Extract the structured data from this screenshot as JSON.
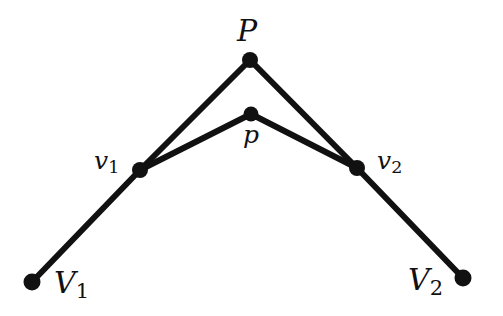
{
  "diagram": {
    "colors": {
      "stroke": "#111111",
      "background": "#ffffff"
    },
    "nodes": {
      "P": {
        "label": "P",
        "x": 250,
        "y": 60
      },
      "p": {
        "label": "p",
        "x": 251,
        "y": 114
      },
      "v1": {
        "label": "v",
        "sub": "1",
        "x": 140,
        "y": 170
      },
      "v2": {
        "label": "v",
        "sub": "2",
        "x": 357,
        "y": 168
      },
      "V1": {
        "label": "V",
        "sub": "1",
        "x": 32,
        "y": 282
      },
      "V2": {
        "label": "V",
        "sub": "2",
        "x": 463,
        "y": 278
      }
    },
    "edges": [
      [
        "V1",
        "v1"
      ],
      [
        "v1",
        "P"
      ],
      [
        "P",
        "v2"
      ],
      [
        "v2",
        "V2"
      ],
      [
        "v1",
        "p"
      ],
      [
        "p",
        "v2"
      ]
    ]
  }
}
